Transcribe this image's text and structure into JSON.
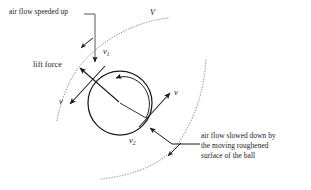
{
  "figure": {
    "background_color": "#ffffff",
    "ink_color": "#1a1a1a",
    "streamline_color": "#8c8c8c",
    "width": 311,
    "height": 190
  },
  "labels": {
    "air_speeded_up": "air flow speeded up",
    "lift_force": "lift force",
    "air_slowed_down": "air flow slowed down by\nthe moving roughened\nsurface of the ball",
    "free_stream_velocity": "V",
    "velocity_top": "v",
    "velocity_top_sub": "1",
    "velocity_left": "v",
    "velocity_right": "v",
    "velocity_bottom": "v",
    "velocity_bottom_sub": "2"
  },
  "shapes": {
    "ball": {
      "cx": 120,
      "cy": 103,
      "r": 32
    },
    "spin_direction": "counterclockwise",
    "upper_streamline": "dotted arc above the ball, flow arrow pointing down-left",
    "lower_streamline": "dotted arc below-right of the ball, flow arrow pointing down-left"
  }
}
